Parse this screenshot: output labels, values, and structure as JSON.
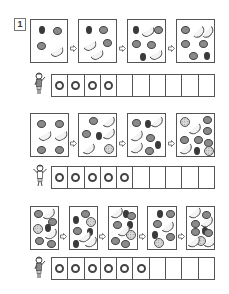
{
  "problem": {
    "number": "1"
  },
  "rows": [
    {
      "panels": [
        {
          "fruits": [
            {
              "t": "berry",
              "x": 8,
              "y": 6
            },
            {
              "t": "apple",
              "x": 22,
              "y": 7
            },
            {
              "t": "apple",
              "x": 6,
              "y": 22
            },
            {
              "t": "banana",
              "x": 20,
              "y": 30,
              "r": -30
            }
          ]
        },
        {
          "fruits": [
            {
              "t": "berry",
              "x": 7,
              "y": 6
            },
            {
              "t": "apple",
              "x": 20,
              "y": 6
            },
            {
              "t": "banana",
              "x": 5,
              "y": 24,
              "r": -30
            },
            {
              "t": "apple",
              "x": 24,
              "y": 19
            },
            {
              "t": "banana",
              "x": 12,
              "y": 33,
              "r": -30
            }
          ]
        },
        {
          "fruits": [
            {
              "t": "berry",
              "x": 5,
              "y": 6
            },
            {
              "t": "banana",
              "x": 14,
              "y": 10,
              "r": -30
            },
            {
              "t": "apple",
              "x": 26,
              "y": 6
            },
            {
              "t": "apple",
              "x": 4,
              "y": 20
            },
            {
              "t": "apple",
              "x": 19,
              "y": 21
            },
            {
              "t": "berry",
              "x": 12,
              "y": 33
            },
            {
              "t": "banana",
              "x": 22,
              "y": 33,
              "r": -30
            }
          ]
        },
        {
          "fruits": [
            {
              "t": "apple",
              "x": 4,
              "y": 6
            },
            {
              "t": "banana",
              "x": 16,
              "y": 10,
              "r": -50
            },
            {
              "t": "banana",
              "x": 25,
              "y": 10,
              "r": -50
            },
            {
              "t": "apple",
              "x": 4,
              "y": 20
            },
            {
              "t": "apple",
              "x": 22,
              "y": 20
            },
            {
              "t": "apple",
              "x": 12,
              "y": 32
            },
            {
              "t": "berry",
              "x": 29,
              "y": 32
            }
          ]
        }
      ],
      "answer_count": 4,
      "total_cells": 10
    },
    {
      "panels": [
        {
          "fruits": [
            {
              "t": "apple",
              "x": 6,
              "y": 6
            },
            {
              "t": "apple",
              "x": 24,
              "y": 6
            },
            {
              "t": "banana",
              "x": 8,
              "y": 20,
              "r": -30
            },
            {
              "t": "banana",
              "x": 24,
              "y": 20,
              "r": -30
            },
            {
              "t": "apple",
              "x": 6,
              "y": 32
            },
            {
              "t": "apple",
              "x": 24,
              "y": 32
            }
          ]
        },
        {
          "fruits": [
            {
              "t": "apple",
              "x": 10,
              "y": 3
            },
            {
              "t": "banana",
              "x": 24,
              "y": 6,
              "r": -40
            },
            {
              "t": "apple",
              "x": 3,
              "y": 16
            },
            {
              "t": "berry",
              "x": 17,
              "y": 18
            },
            {
              "t": "banana",
              "x": 24,
              "y": 18,
              "r": -40
            },
            {
              "t": "banana",
              "x": 4,
              "y": 33,
              "r": -40
            },
            {
              "t": "melon",
              "x": 25,
              "y": 30
            }
          ]
        },
        {
          "fruits": [
            {
              "t": "apple",
              "x": 4,
              "y": 5
            },
            {
              "t": "berry",
              "x": 17,
              "y": 6
            },
            {
              "t": "banana",
              "x": 23,
              "y": 6,
              "r": -40
            },
            {
              "t": "banana",
              "x": 3,
              "y": 20,
              "r": -40
            },
            {
              "t": "apple",
              "x": 18,
              "y": 20
            },
            {
              "t": "banana",
              "x": 3,
              "y": 32,
              "r": -40
            },
            {
              "t": "apple",
              "x": 17,
              "y": 33
            },
            {
              "t": "berry",
              "x": 30,
              "y": 27
            }
          ]
        },
        {
          "fruits": [
            {
              "t": "melon",
              "x": 3,
              "y": 3
            },
            {
              "t": "apple",
              "x": 26,
              "y": 2
            },
            {
              "t": "banana",
              "x": 12,
              "y": 13,
              "r": -40
            },
            {
              "t": "apple",
              "x": 26,
              "y": 13
            },
            {
              "t": "apple",
              "x": 3,
              "y": 22
            },
            {
              "t": "apple",
              "x": 17,
              "y": 22
            },
            {
              "t": "apple",
              "x": 29,
              "y": 25
            },
            {
              "t": "banana",
              "x": 3,
              "y": 34,
              "r": -40
            },
            {
              "t": "berry",
              "x": 17,
              "y": 34
            },
            {
              "t": "melon",
              "x": 27,
              "y": 32
            }
          ]
        }
      ],
      "answer_count": 5,
      "total_cells": 10
    },
    {
      "panels": [
        {
          "fruits": [
            {
              "t": "apple",
              "x": 3,
              "y": 3
            },
            {
              "t": "banana",
              "x": 12,
              "y": 5,
              "r": -40
            },
            {
              "t": "apple",
              "x": 17,
              "y": 11
            },
            {
              "t": "melon",
              "x": 2,
              "y": 17
            },
            {
              "t": "berry",
              "x": 14,
              "y": 17
            },
            {
              "t": "banana",
              "x": 14,
              "y": 25,
              "r": -40
            },
            {
              "t": "apple",
              "x": 4,
              "y": 30
            },
            {
              "t": "apple",
              "x": 16,
              "y": 34
            }
          ]
        },
        {
          "fruits": [
            {
              "t": "apple",
              "x": 11,
              "y": 3
            },
            {
              "t": "berry",
              "x": 3,
              "y": 9
            },
            {
              "t": "melon",
              "x": 16,
              "y": 10
            },
            {
              "t": "apple",
              "x": 3,
              "y": 20
            },
            {
              "t": "berry",
              "x": 17,
              "y": 21
            },
            {
              "t": "banana",
              "x": 9,
              "y": 28,
              "r": -40
            },
            {
              "t": "berry",
              "x": 3,
              "y": 34
            },
            {
              "t": "banana",
              "x": 15,
              "y": 36,
              "r": -40
            }
          ]
        },
        {
          "fruits": [
            {
              "t": "banana",
              "x": 2,
              "y": 4,
              "r": -40
            },
            {
              "t": "berry",
              "x": 14,
              "y": 3
            },
            {
              "t": "apple",
              "x": 19,
              "y": 5
            },
            {
              "t": "apple",
              "x": 4,
              "y": 14
            },
            {
              "t": "berry",
              "x": 20,
              "y": 14
            },
            {
              "t": "banana",
              "x": 9,
              "y": 22,
              "r": -40
            },
            {
              "t": "melon",
              "x": 17,
              "y": 23
            },
            {
              "t": "apple",
              "x": 2,
              "y": 30
            },
            {
              "t": "apple",
              "x": 12,
              "y": 34
            }
          ]
        },
        {
          "fruits": [
            {
              "t": "berry",
              "x": 9,
              "y": 3
            },
            {
              "t": "apple",
              "x": 18,
              "y": 3
            },
            {
              "t": "apple",
              "x": 5,
              "y": 13
            },
            {
              "t": "banana",
              "x": 14,
              "y": 18,
              "r": -40
            },
            {
              "t": "berry",
              "x": 4,
              "y": 24
            },
            {
              "t": "apple",
              "x": 19,
              "y": 26
            },
            {
              "t": "melon",
              "x": 6,
              "y": 31
            }
          ]
        },
        {
          "fruits": [
            {
              "t": "banana",
              "x": 2,
              "y": 4,
              "r": -40
            },
            {
              "t": "apple",
              "x": 15,
              "y": 4
            },
            {
              "t": "apple",
              "x": 4,
              "y": 13
            },
            {
              "t": "banana",
              "x": 14,
              "y": 13,
              "r": -40
            },
            {
              "t": "berry",
              "x": 15,
              "y": 20
            },
            {
              "t": "apple",
              "x": 4,
              "y": 21
            },
            {
              "t": "apple",
              "x": 19,
              "y": 22
            },
            {
              "t": "melon",
              "x": 9,
              "y": 29
            },
            {
              "t": "banana",
              "x": 1,
              "y": 36,
              "r": -40
            },
            {
              "t": "banana",
              "x": 17,
              "y": 36,
              "r": -40
            }
          ]
        }
      ],
      "answer_count": 6,
      "total_cells": 10
    }
  ],
  "colors": {
    "line": "#555555",
    "ring": "#444444",
    "apple": "#8a8a8a",
    "berry": "#3a3a3a"
  }
}
